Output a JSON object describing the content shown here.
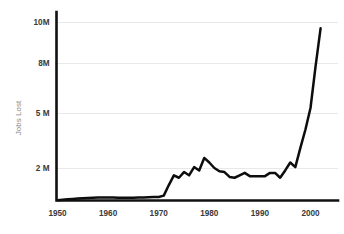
{
  "chart_data": {
    "type": "line",
    "title": "",
    "xlabel": "",
    "ylabel": "Jobs Lost",
    "xlim": [
      1950,
      2002
    ],
    "ylim": [
      0,
      10.6
    ],
    "grid": true,
    "legend": null,
    "y_tick_labels": [
      "10M",
      "8M",
      "5 M",
      "2 M"
    ],
    "y_tick_values": [
      10,
      8,
      5,
      2
    ],
    "x_tick_labels": [
      "1950",
      "1960",
      "1970",
      "1980",
      "1990",
      "2000"
    ],
    "x_tick_values": [
      1950,
      1960,
      1970,
      1980,
      1990,
      2000
    ],
    "series": [
      {
        "name": "Jobs Lost",
        "color": "#0d0d0d",
        "x": [
          1950,
          1951,
          1952,
          1953,
          1954,
          1955,
          1956,
          1957,
          1958,
          1959,
          1960,
          1961,
          1962,
          1963,
          1964,
          1965,
          1966,
          1967,
          1968,
          1969,
          1970,
          1971,
          1972,
          1973,
          1974,
          1975,
          1976,
          1977,
          1978,
          1979,
          1980,
          1981,
          1982,
          1983,
          1984,
          1985,
          1986,
          1987,
          1988,
          1989,
          1990,
          1991,
          1992,
          1993,
          1994,
          1995,
          1996,
          1997,
          1998,
          1999,
          2000,
          2001,
          2002
        ],
        "values": [
          0.02,
          0.05,
          0.08,
          0.1,
          0.12,
          0.14,
          0.16,
          0.17,
          0.18,
          0.18,
          0.18,
          0.18,
          0.17,
          0.17,
          0.17,
          0.17,
          0.18,
          0.19,
          0.2,
          0.21,
          0.22,
          0.3,
          0.95,
          1.55,
          1.4,
          1.75,
          1.55,
          2.05,
          1.85,
          2.55,
          2.3,
          2.0,
          1.8,
          1.75,
          1.45,
          1.4,
          1.55,
          1.7,
          1.5,
          1.5,
          1.5,
          1.5,
          1.7,
          1.7,
          1.4,
          1.85,
          2.3,
          2.05,
          3.1,
          4.1,
          5.3,
          7.8,
          9.7
        ]
      }
    ],
    "annotations": []
  },
  "axis": {
    "y_title": "Jobs Lost"
  },
  "colors": {
    "line": "#0d0d0d",
    "grid": "#e8e8e8",
    "axis": "#111111",
    "tick_text": "#3a3a3a",
    "axis_title": "#8a8a8a",
    "background": "#ffffff"
  }
}
